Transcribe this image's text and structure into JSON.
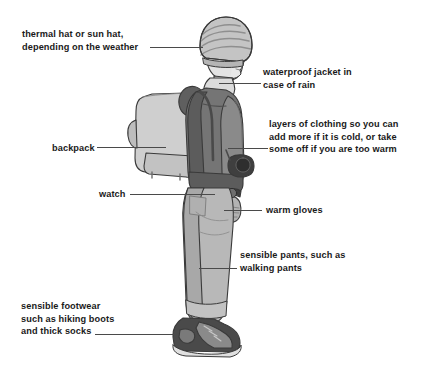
{
  "diagram": {
    "background_color": "#ffffff",
    "text_color": "#1a1a1a",
    "leader_line_color": "#4a4a4a",
    "annotations": [
      {
        "id": "hat",
        "text": "thermal hat or sun hat,\ndepending on the weather",
        "side": "left",
        "points_to": "beanie-hat"
      },
      {
        "id": "jacket",
        "text": "waterproof jacket in\ncase of rain",
        "side": "right",
        "points_to": "jacket-collar"
      },
      {
        "id": "backpack",
        "text": "backpack",
        "side": "left",
        "points_to": "backpack-body"
      },
      {
        "id": "layers",
        "text": "layers of clothing so you can\nadd more if it is cold, or take\nsome off if you are too warm",
        "side": "right",
        "points_to": "torso-layers"
      },
      {
        "id": "watch",
        "text": "watch",
        "side": "left",
        "points_to": "wrist-watch"
      },
      {
        "id": "gloves",
        "text": "warm gloves",
        "side": "right",
        "points_to": "hand-gloves"
      },
      {
        "id": "pants",
        "text": "sensible pants, such as\nwalking pants",
        "side": "right",
        "points_to": "trousers"
      },
      {
        "id": "footwear",
        "text": "sensible footwear\nsuch as hiking boots\nand thick socks",
        "side": "left",
        "points_to": "hiking-boots"
      }
    ],
    "figure_colors": {
      "hat_light": "#c9c9c9",
      "hat_dark": "#8f8f8f",
      "skin": "#e3e3e3",
      "skin_shadow": "#c0c0c0",
      "jacket_dark": "#6e6e6e",
      "jacket_mid": "#8a8a8a",
      "jacket_shadow": "#4f4f4f",
      "backpack": "#cfcfcf",
      "backpack_shadow": "#b0b0b0",
      "pants": "#b8b8b8",
      "pants_shadow": "#9e9e9e",
      "boots_dark": "#4a4a4a",
      "boots_mid": "#8a8a8a",
      "outline": "#3a3a3a",
      "camera": "#3f3f3f"
    }
  }
}
